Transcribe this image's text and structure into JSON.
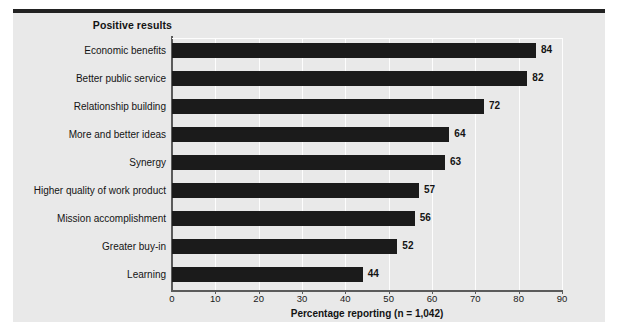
{
  "chart_data": {
    "type": "bar",
    "orientation": "horizontal",
    "title": "Positive results",
    "xlabel": "Percentage reporting (n = 1,042)",
    "ylabel": "",
    "xlim": [
      0,
      90
    ],
    "xticks": [
      "0",
      "10",
      "20",
      "30",
      "40",
      "50",
      "60",
      "70",
      "80",
      "90"
    ],
    "grid": "vertical",
    "legend": "none",
    "categories": [
      "Economic benefits",
      "Better public service",
      "Relationship building",
      "More and better ideas",
      "Synergy",
      "Higher quality of work product",
      "Mission accomplishment",
      "Greater buy-in",
      "Learning"
    ],
    "values": [
      84,
      82,
      72,
      64,
      63,
      57,
      56,
      52,
      44
    ],
    "value_labels": [
      "84",
      "82",
      "72",
      "64",
      "63",
      "57",
      "56",
      "52",
      "44"
    ],
    "colors": {
      "bar": "#1b1b1b",
      "panel": "#e9e9e9",
      "grid": "#fdfdfd",
      "axis": "#5b5b5b",
      "rule": "#222222",
      "text": "#141414"
    }
  }
}
